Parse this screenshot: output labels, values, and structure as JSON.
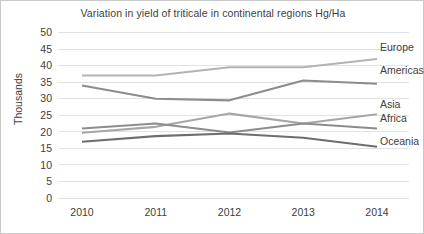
{
  "chart_data": {
    "type": "line",
    "title": "Variation in yield of triticale in continental regions Hg/Ha",
    "xlabel": "",
    "ylabel": "Thousands",
    "categories": [
      "2010",
      "2011",
      "2012",
      "2013",
      "2014"
    ],
    "x": [
      2010,
      2011,
      2012,
      2013,
      2014
    ],
    "ylim": [
      0,
      50
    ],
    "ytick_step": 5,
    "yticks": [
      "0",
      "5",
      "10",
      "15",
      "20",
      "25",
      "30",
      "35",
      "40",
      "45",
      "50"
    ],
    "grid": true,
    "legend_position": "right-inline-labels",
    "series": [
      {
        "name": "Europe",
        "color": "#b3b3b3",
        "values": [
          37,
          37,
          39.5,
          39.5,
          42
        ],
        "label_x": 2014,
        "label_y": 45.5
      },
      {
        "name": "Americas",
        "color": "#8c8c8c",
        "values": [
          34,
          30,
          29.5,
          35.5,
          34.5
        ],
        "label_x": 2014,
        "label_y": 38.5
      },
      {
        "name": "Asia",
        "color": "#a6a6a6",
        "values": [
          19.7,
          21.5,
          25.5,
          22.5,
          25.3
        ],
        "label_x": 2014,
        "label_y": 28.3
      },
      {
        "name": "Africa",
        "color": "#8c8c8c",
        "values": [
          21,
          22.5,
          19.8,
          22.5,
          21
        ],
        "label_x": 2014,
        "label_y": 24.0
      },
      {
        "name": "Oceania",
        "color": "#6e6e6e",
        "values": [
          17,
          18.7,
          19.5,
          18.2,
          15.5
        ],
        "label_x": 2014,
        "label_y": 17.2
      }
    ]
  },
  "colors": {
    "background": "#ffffff",
    "border": "#c9c9c9",
    "text": "#404040",
    "gridline": "#e2e2e2"
  }
}
